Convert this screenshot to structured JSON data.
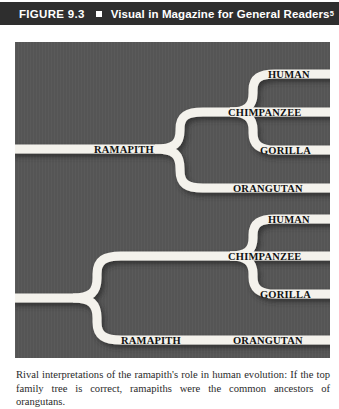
{
  "header": {
    "figure_number": "FIGURE 9.3",
    "separator_icon": "square-bullet-icon",
    "title": "Visual in Magazine for General Readers",
    "superscript": "5"
  },
  "diagram": {
    "background_color": "#555555",
    "ribbon_color": "#f4f2ec",
    "shadow_color": "#3f3f3f",
    "trees": [
      {
        "id": "top-tree",
        "root_label": "RAMAPITH",
        "tips": [
          "HUMAN",
          "CHIMPANZEE",
          "GORILLA",
          "ORANGUTAN"
        ]
      },
      {
        "id": "bottom-tree",
        "root_label": "RAMAPITH",
        "tips": [
          "HUMAN",
          "CHIMPANZEE",
          "GORILLA",
          "ORANGUTAN"
        ]
      }
    ],
    "labels": {
      "top_ramapith": "RAMAPITH",
      "top_human": "HUMAN",
      "top_chimpanzee": "CHIMPANZEE",
      "top_gorilla": "GORILLA",
      "top_orangutan": "ORANGUTAN",
      "bottom_ramapith": "RAMAPITH",
      "bottom_human": "HUMAN",
      "bottom_chimpanzee": "CHIMPANZEE",
      "bottom_gorilla": "GORILLA",
      "bottom_orangutan": "ORANGUTAN"
    }
  },
  "caption": {
    "text": "Rival interpretations of the ramapith's role in human evolution: If the top family tree is correct, ramapiths were the common ancestors of orangutans."
  }
}
